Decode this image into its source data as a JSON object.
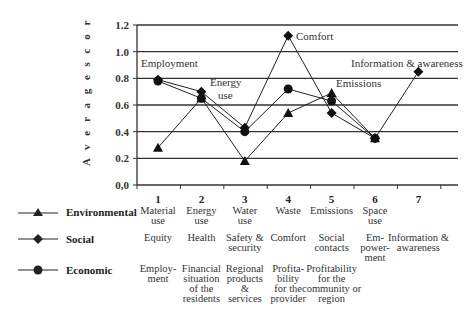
{
  "chart_data": {
    "type": "line",
    "title": "",
    "xlabel": "",
    "ylabel": "Average scor",
    "ylim": [
      0.0,
      1.2
    ],
    "yticks": [
      "0,0",
      "0.2",
      "0.4",
      "0.6",
      "0.8",
      "1.0",
      "1.2"
    ],
    "grid": true,
    "categories": [
      "1",
      "2",
      "3",
      "4",
      "5",
      "6",
      "7"
    ],
    "series": [
      {
        "name": "Environmental",
        "marker": "triangle",
        "values": [
          0.28,
          0.65,
          0.18,
          0.54,
          0.69,
          0.35,
          null
        ],
        "labels": [
          "Material use",
          "Energy use",
          "Water use",
          "Waste",
          "Emissions",
          "Space use",
          ""
        ]
      },
      {
        "name": "Social",
        "marker": "diamond",
        "values": [
          0.79,
          0.7,
          0.43,
          1.12,
          0.54,
          0.35,
          0.85
        ],
        "labels": [
          "Equity",
          "Health",
          "Safety & security",
          "Comfort",
          "Social contacts",
          "Em-power-ment",
          "Information & awareness"
        ]
      },
      {
        "name": "Economic",
        "marker": "circle",
        "values": [
          0.78,
          0.65,
          0.4,
          0.72,
          0.63,
          0.35,
          null
        ],
        "labels": [
          "Employ-ment",
          "Financial situation of the residents",
          "Regional products & services",
          "Profita-bility for the provider",
          "Profitability for the community or region",
          "",
          ""
        ]
      }
    ],
    "annotations": [
      "Employment",
      "Energy use",
      "Comfort",
      "Emissions",
      "Information & awareness"
    ],
    "legend_position": "bottom-left table"
  },
  "axis": {
    "ylabel": "A v e r a g e  s c o r",
    "yticks": [
      "1.2",
      "1.0",
      "0.8",
      "0.6",
      "0.4",
      "0.2",
      "0,0"
    ]
  },
  "annotations": {
    "employment": "Employment",
    "energy1": "Energy",
    "energy2": "use",
    "comfort": "Comfort",
    "emissions": "Emissions",
    "info": "Information & awareness"
  },
  "legend": [
    {
      "name": "Environmental"
    },
    {
      "name": "Social"
    },
    {
      "name": "Economic"
    }
  ],
  "table": {
    "numbers": [
      "1",
      "2",
      "3",
      "4",
      "5",
      "6",
      "7"
    ],
    "environmental": [
      [
        "Material",
        "use"
      ],
      [
        "Energy",
        "use"
      ],
      [
        "Water",
        "use"
      ],
      [
        "Waste"
      ],
      [
        "Emissions"
      ],
      [
        "Space",
        "use"
      ],
      []
    ],
    "social": [
      [
        "Equity"
      ],
      [
        "Health"
      ],
      [
        "Safety &",
        "security"
      ],
      [
        "Comfort"
      ],
      [
        "Social",
        "contacts"
      ],
      [
        "Em-",
        "power-",
        "ment"
      ],
      [
        "Information &",
        "awareness"
      ]
    ],
    "economic": [
      [
        "Employ-",
        "ment"
      ],
      [
        "Financial",
        "situation",
        "of the",
        "residents"
      ],
      [
        "Regional",
        "products",
        "&",
        "services"
      ],
      [
        "Profita-",
        "bility",
        "for the",
        "provider"
      ],
      [
        "Profitability",
        "for the",
        "community or",
        "region"
      ],
      [],
      []
    ]
  }
}
